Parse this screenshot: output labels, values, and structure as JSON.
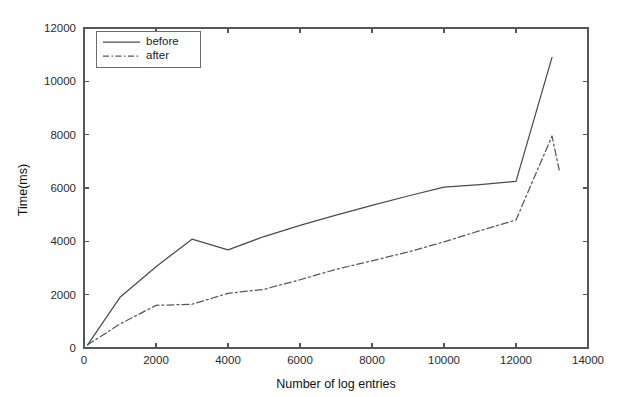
{
  "chart_data": {
    "type": "line",
    "title": "",
    "xlabel": "Number of log entries",
    "ylabel": "Time(ms)",
    "xlim": [
      0,
      14000
    ],
    "ylim": [
      0,
      12000
    ],
    "xticks": [
      0,
      2000,
      4000,
      6000,
      8000,
      10000,
      12000,
      14000
    ],
    "yticks": [
      0,
      2000,
      4000,
      6000,
      8000,
      10000,
      12000
    ],
    "xtick_labels": [
      "0",
      "2000",
      "4000",
      "6000",
      "8000",
      "10000",
      "12000",
      "14000"
    ],
    "ytick_labels": [
      "0",
      "2000",
      "4000",
      "6000",
      "8000",
      "10000",
      "12000"
    ],
    "grid": false,
    "legend_position": "upper left",
    "series": [
      {
        "name": "before",
        "style": "solid",
        "color": "#4a4c50",
        "x": [
          100,
          1000,
          2000,
          3000,
          4000,
          5000,
          6000,
          7000,
          8000,
          9000,
          10000,
          11000,
          12000,
          13000
        ],
        "y": [
          120,
          1900,
          3050,
          4080,
          3680,
          4180,
          4600,
          4980,
          5350,
          5700,
          6030,
          6130,
          6250,
          10900
        ]
      },
      {
        "name": "after",
        "style": "dash-dot",
        "color": "#55575b",
        "x": [
          100,
          1000,
          2000,
          2500,
          3000,
          4000,
          5000,
          6000,
          7000,
          8000,
          9000,
          10000,
          11000,
          12000,
          13000,
          13200
        ],
        "y": [
          120,
          900,
          1600,
          1620,
          1640,
          2050,
          2200,
          2560,
          2950,
          3270,
          3600,
          3980,
          4400,
          4800,
          7950,
          6680
        ]
      }
    ]
  },
  "legend": {
    "entries": [
      {
        "label": "before"
      },
      {
        "label": "after"
      }
    ]
  },
  "axes": {
    "x_title": "Number of log entries",
    "y_title": "Time(ms)"
  }
}
